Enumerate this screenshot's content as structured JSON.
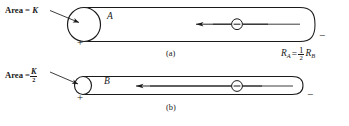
{
  "figure": {
    "background_color": "#ffffff",
    "line_color": "#1a1a1a",
    "panels": [
      {
        "id": "a",
        "caption": "(a)",
        "area_label_prefix": "Area =",
        "area_label_value": "K",
        "area_is_fraction": false,
        "area_numerator": "K",
        "area_denominator": "",
        "cylinder_label": "A",
        "left_terminal_sign": "+",
        "right_terminal_sign": "−",
        "carrier_symbol": "⊖",
        "carrier_name": "electron",
        "current_arrow_direction": "left"
      },
      {
        "id": "b",
        "caption": "(b)",
        "area_label_prefix": "Area =",
        "area_label_value": "K/2",
        "area_is_fraction": true,
        "area_numerator": "K",
        "area_denominator": "2",
        "cylinder_label": "B",
        "left_terminal_sign": "+",
        "right_terminal_sign": "−",
        "carrier_symbol": "⊖",
        "carrier_name": "electron",
        "current_arrow_direction": "left"
      }
    ],
    "equation": {
      "lhs": "R",
      "lhs_sub": "A",
      "relation": "=",
      "coefficient_numerator": "1",
      "coefficient_denominator": "2",
      "rhs": "R",
      "rhs_sub": "B",
      "plain_text": "R_A = 1/2 R_B"
    }
  }
}
